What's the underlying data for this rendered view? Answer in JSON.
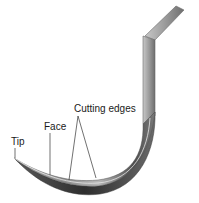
{
  "diagram": {
    "labels": {
      "tip": "Tip",
      "face": "Face",
      "cutting_edges": "Cutting edges"
    },
    "colors": {
      "background": "#ffffff",
      "metal_light": "#d8d8d8",
      "metal_mid": "#9a9a9a",
      "metal_dark": "#4a4a4a",
      "leader_lines": "#333333"
    }
  }
}
